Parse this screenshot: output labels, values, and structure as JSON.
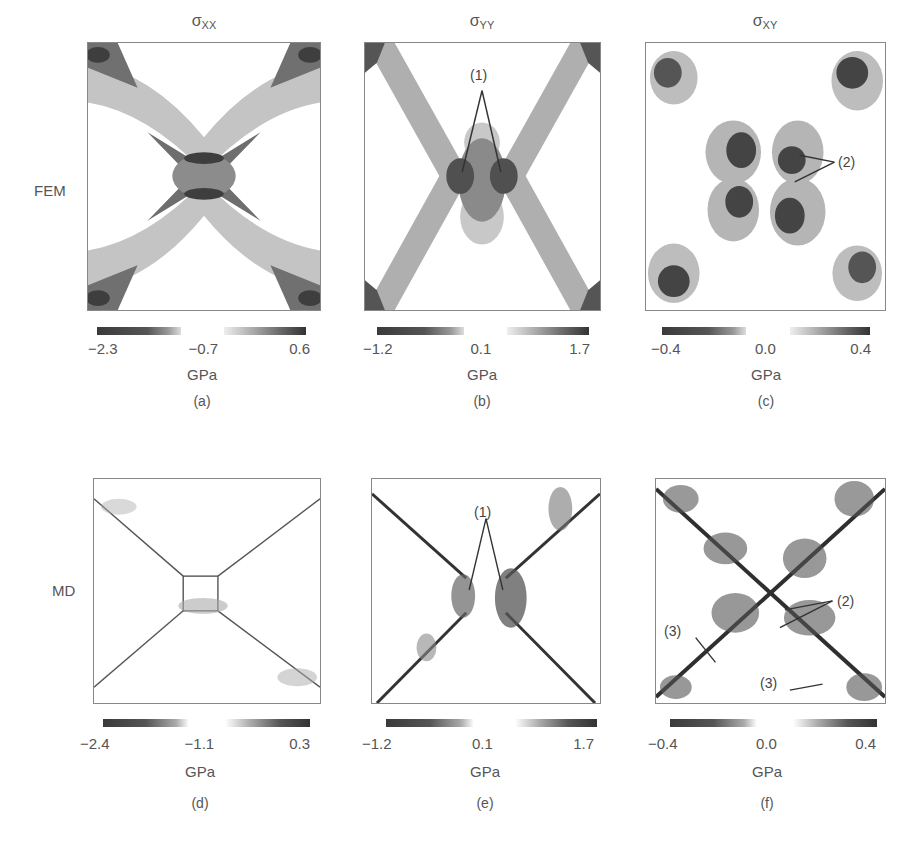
{
  "figure": {
    "column_titles": [
      {
        "symbol": "σ",
        "sub": "XX"
      },
      {
        "symbol": "σ",
        "sub": "YY"
      },
      {
        "symbol": "σ",
        "sub": "XY"
      }
    ],
    "row_labels": [
      "FEM",
      "MD"
    ],
    "panels": [
      {
        "id": "a",
        "caption": "(a)",
        "method": "FEM",
        "component": "σXX",
        "colorbar_ticks": [
          "−2.3",
          "−0.7",
          "0.6"
        ],
        "unit": "GPa",
        "annotations": []
      },
      {
        "id": "b",
        "caption": "(b)",
        "method": "FEM",
        "component": "σYY",
        "colorbar_ticks": [
          "−1.2",
          "0.1",
          "1.7"
        ],
        "unit": "GPa",
        "annotations": [
          "(1)"
        ]
      },
      {
        "id": "c",
        "caption": "(c)",
        "method": "FEM",
        "component": "σXY",
        "colorbar_ticks": [
          "−0.4",
          "0.0",
          "0.4"
        ],
        "unit": "GPa",
        "annotations": [
          "(2)"
        ]
      },
      {
        "id": "d",
        "caption": "(d)",
        "method": "MD",
        "component": "σXX",
        "colorbar_ticks": [
          "−2.4",
          "−1.1",
          "0.3"
        ],
        "unit": "GPa",
        "annotations": []
      },
      {
        "id": "e",
        "caption": "(e)",
        "method": "MD",
        "component": "σYY",
        "colorbar_ticks": [
          "−1.2",
          "0.1",
          "1.7"
        ],
        "unit": "GPa",
        "annotations": [
          "(1)"
        ]
      },
      {
        "id": "f",
        "caption": "(f)",
        "method": "MD",
        "component": "σXY",
        "colorbar_ticks": [
          "−0.4",
          "0.0",
          "0.4"
        ],
        "unit": "GPa",
        "annotations": [
          "(2)",
          "(3)",
          "(3)"
        ]
      }
    ]
  },
  "colors": {
    "dark": "#3a3a3a",
    "mid": "#7a7a7a",
    "light": "#bdbdbd",
    "frame": "#888888"
  }
}
